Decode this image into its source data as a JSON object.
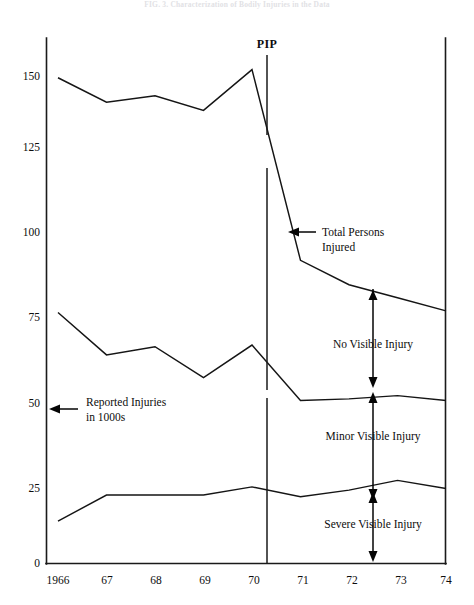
{
  "figure": {
    "title": "FIG. 3.  Characterization of Bodily Injuries in the Data",
    "title_visible": "faded"
  },
  "chart_data": {
    "type": "line",
    "title": "",
    "xlabel": "",
    "ylabel": "Reported Injuries in 1000s",
    "ylim": [
      0,
      160
    ],
    "xlim": [
      1966,
      1974
    ],
    "grid": false,
    "legend": "none",
    "x": [
      1966,
      1967,
      1968,
      1969,
      1970,
      1971,
      1972,
      1973,
      1974
    ],
    "categories": [
      "1966",
      "67",
      "68",
      "69",
      "70",
      "71",
      "72",
      "73",
      "74"
    ],
    "yticks": [
      0,
      25,
      50,
      75,
      100,
      125,
      150
    ],
    "ytick_labels": [
      "0",
      "25",
      "50",
      "75",
      "100",
      "125",
      "150"
    ],
    "series": [
      {
        "name": "Total Persons Injured",
        "values": [
          149,
          141.5,
          143.5,
          139,
          151.5,
          93,
          85.5,
          81.5,
          77.5
        ]
      },
      {
        "name": "Minor + Severe Visible Injury (upper bound)",
        "values": [
          77,
          64,
          66.5,
          57,
          67,
          50,
          50.5,
          51.5,
          50
        ]
      },
      {
        "name": "Severe Visible Injury (upper bound)",
        "values": [
          13,
          21,
          21,
          21,
          23.5,
          20.5,
          22.5,
          25.5,
          23
        ]
      }
    ],
    "annotations": [
      {
        "id": "total-persons-injured",
        "text": "Total Persons Injured",
        "lines": [
          "Total Persons",
          "Injured"
        ],
        "arrow": "left"
      },
      {
        "id": "no-visible-injury",
        "text": "No Visible Injury",
        "arrow": "double-vertical"
      },
      {
        "id": "minor-visible-injury",
        "text": "Minor Visible Injury",
        "arrow": "double-vertical"
      },
      {
        "id": "severe-visible-injury",
        "text": "Severe Visible Injury",
        "arrow": "double-vertical"
      },
      {
        "id": "reported-injuries-axis-label",
        "text": "Reported Injuries in 1000s",
        "lines": [
          "Reported Injuries",
          "in 1000s"
        ],
        "arrow": "left"
      },
      {
        "id": "pip-marker",
        "text": "PIP",
        "x_position": 1970.35,
        "description": "vertical reference line marking PIP introduction"
      }
    ],
    "colors": {
      "line": "#151515",
      "axis": "#1a1a1a",
      "background": "#ffffff"
    }
  },
  "labels": {
    "pip": "PIP",
    "total_persons_1": "Total Persons",
    "total_persons_2": "Injured",
    "no_visible": "No Visible Injury",
    "minor_visible": "Minor Visible Injury",
    "severe_visible": "Severe Visible Injury",
    "reported_1": "Reported Injuries",
    "reported_2": "in 1000s",
    "y0": "0",
    "y25": "25",
    "y50": "50",
    "y75": "75",
    "y100": "100",
    "y125": "125",
    "y150": "150",
    "x1966": "1966",
    "x67": "67",
    "x68": "68",
    "x69": "69",
    "x70": "70",
    "x71": "71",
    "x72": "72",
    "x73": "73",
    "x74": "74"
  }
}
